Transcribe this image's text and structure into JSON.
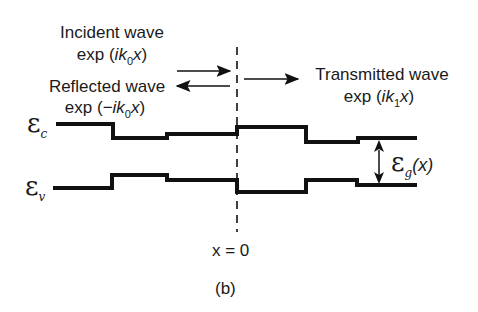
{
  "figure": {
    "caption": "(b)",
    "position_label": "x = 0"
  },
  "waves": {
    "incident": {
      "title": "Incident wave",
      "exp_prefix": "exp (",
      "exp_i": "ik",
      "exp_sub": "0",
      "exp_x": "x",
      "exp_suffix": ")"
    },
    "reflected": {
      "title": "Reflected wave",
      "exp_prefix": "exp (−",
      "exp_i": "ik",
      "exp_sub": "0",
      "exp_x": "x",
      "exp_suffix": ")"
    },
    "transmitted": {
      "title": "Transmitted wave",
      "exp_prefix": "exp (",
      "exp_i": "ik",
      "exp_sub": "1",
      "exp_x": "x",
      "exp_suffix": ")"
    }
  },
  "bands": {
    "conduction": {
      "symbol": "ε",
      "subscript": "c"
    },
    "valence": {
      "symbol": "ε",
      "subscript": "v"
    },
    "gap": {
      "symbol": "ε",
      "subscript": "g",
      "arg": "(x)"
    }
  },
  "colors": {
    "line": "#111111",
    "background": "#ffffff"
  }
}
